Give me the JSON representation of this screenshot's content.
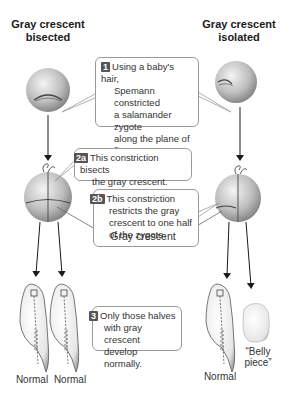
{
  "headings": {
    "left": "Gray crescent bisected",
    "left_line1": "Gray crescent",
    "left_line2": "bisected",
    "right_line1": "Gray crescent",
    "right_line2": "isolated"
  },
  "callouts": {
    "step1": {
      "badge": "1",
      "lines": [
        "Using a baby's hair,",
        "Spemann constricted",
        "a salamander zygote",
        "along the plane of first",
        "cleavage."
      ]
    },
    "step2a": {
      "badge": "2a",
      "lines": [
        "This constriction bisects",
        "the gray crescent."
      ]
    },
    "step2b": {
      "badge": "2b",
      "lines": [
        "This constriction",
        "restricts the gray",
        "crescent to one half",
        "of the zygote."
      ]
    },
    "step3": {
      "badge": "3",
      "lines": [
        "Only those halves",
        "with gray crescent",
        "develop normally."
      ]
    }
  },
  "labels": {
    "gray_crescent": "Gray crescent",
    "normal_1": "Normal",
    "normal_2": "Normal",
    "normal_3": "Normal",
    "belly_piece_line1": "“Belly",
    "belly_piece_line2": "piece”"
  },
  "colors": {
    "badge_bg": "#555555",
    "callout_border": "#9a9a9a",
    "zygote_light": "#e8e8e8",
    "zygote_dark": "#8c8c8c",
    "arrow": "#1a1a1a"
  }
}
